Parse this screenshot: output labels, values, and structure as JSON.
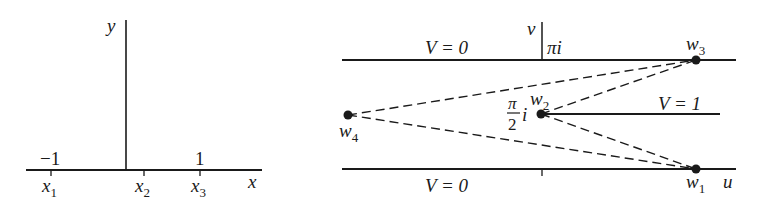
{
  "left_panel": {
    "axis_x_label": "x",
    "axis_y_label": "y",
    "tick_minus_one": "−1",
    "tick_one": "1",
    "points": [
      {
        "name": "x",
        "sub": "1"
      },
      {
        "name": "x",
        "sub": "2"
      },
      {
        "name": "x",
        "sub": "3"
      }
    ]
  },
  "right_panel": {
    "axis_u_label": "u",
    "axis_v_label": "v",
    "top_line_label": "V = 0",
    "bottom_line_label": "V = 0",
    "middle_line_label": "V = 1",
    "pi_i_label": "πi",
    "half_pi_num": "π",
    "half_pi_den": "2",
    "half_pi_i": "i",
    "points": [
      {
        "name": "w",
        "sub": "1"
      },
      {
        "name": "w",
        "sub": "2"
      },
      {
        "name": "w",
        "sub": "3"
      },
      {
        "name": "w",
        "sub": "4"
      }
    ]
  },
  "colors": {
    "ink": "#1a1a1a",
    "background": "#ffffff"
  }
}
